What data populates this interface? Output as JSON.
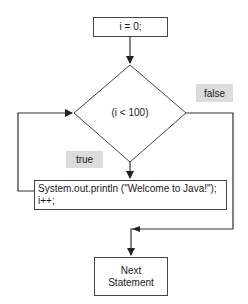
{
  "diagram": {
    "type": "flowchart",
    "title": "",
    "nodes": {
      "init": {
        "label": "i = 0;"
      },
      "condition": {
        "label": "(i < 100)"
      },
      "body": {
        "line1": "System.out.println (\"Welcome to Java!\");",
        "line2": "i++;"
      },
      "next": {
        "line1": "Next",
        "line2": "Statement"
      }
    },
    "edge_labels": {
      "true": "true",
      "false": "false"
    },
    "edges": [
      {
        "from": "init",
        "to": "condition"
      },
      {
        "from": "condition",
        "to": "body",
        "label": "true"
      },
      {
        "from": "body",
        "to": "condition",
        "label": "loop back"
      },
      {
        "from": "condition",
        "to": "next",
        "label": "false"
      }
    ],
    "colors": {
      "line": "#333333",
      "label_bg": "#dcdcdc",
      "node_bg": "#ffffff"
    }
  }
}
